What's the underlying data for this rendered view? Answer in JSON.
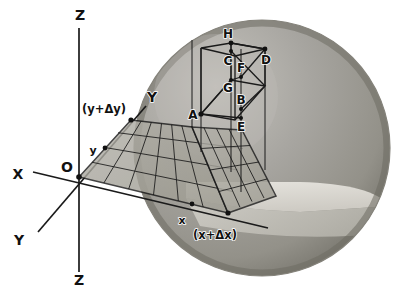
{
  "figure": {
    "background_color": "#ffffff",
    "line_color": "#1a1a1a",
    "sphere": {
      "outer_shade": "#9a9a9a",
      "rim_shade": "#6f6f6f",
      "highlight_shade": "#bdbdbd",
      "cut_face_shade": "#d8d6d0",
      "cut_inner_shade": "#c9c7c1"
    },
    "grid": {
      "fill": "#a8a69f",
      "line_color": "#1a1a1a",
      "columns": 6,
      "rows": 4
    }
  },
  "axes": {
    "z_top": {
      "label": "Z",
      "x": 80,
      "y": 20
    },
    "z_bottom": {
      "label": "Z",
      "x": 79,
      "y": 279
    },
    "x_negative": {
      "label": "X",
      "x": 18,
      "y": 179
    },
    "y_far": {
      "label": "Y",
      "x": 150,
      "y": 100
    },
    "y_near": {
      "label": "Y",
      "x": 19,
      "y": 243
    },
    "origin": {
      "label": "O",
      "x": 67,
      "y": 170
    }
  },
  "axis_ticks": [
    {
      "name": "y-tick",
      "label": "y",
      "x": 92,
      "y": 163
    },
    {
      "name": "y-plus-dy-tick",
      "label": "(y+Δy)",
      "x": 82,
      "y": 113
    },
    {
      "name": "x-tick",
      "label": "x",
      "x": 181,
      "y": 222
    },
    {
      "name": "x-plus-dx-tick",
      "label": "(x+Δx)",
      "x": 193,
      "y": 237
    }
  ],
  "box_vertices": [
    {
      "id": "A",
      "label": "A",
      "label_x": 190,
      "label_y": 121,
      "px": 201,
      "py": 114
    },
    {
      "id": "B",
      "label": "B",
      "label_x": 238,
      "label_y": 103,
      "px": 241,
      "py": 109
    },
    {
      "id": "C",
      "label": "C",
      "label_x": 226,
      "label_y": 64,
      "px": 231,
      "py": 51
    },
    {
      "id": "D",
      "label": "D",
      "label_x": 262,
      "label_y": 62,
      "px": 265,
      "py": 49
    },
    {
      "id": "E",
      "label": "E",
      "label_x": 240,
      "label_y": 127,
      "px": 241,
      "py": 118
    },
    {
      "id": "F",
      "label": "F",
      "label_x": 238,
      "label_y": 70,
      "px": 241,
      "py": 77
    },
    {
      "id": "G",
      "label": "G",
      "label_x": 225,
      "label_y": 89,
      "px": 231,
      "py": 80
    },
    {
      "id": "H",
      "label": "H",
      "label_x": 226,
      "label_y": 38,
      "px": 231,
      "py": 43
    }
  ],
  "legend_note": ""
}
